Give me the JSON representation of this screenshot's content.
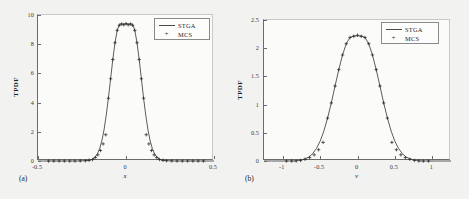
{
  "figure": {
    "background_color": "#f2f2f0",
    "panels": [
      {
        "sublabel": "(a)",
        "xlabel": "x",
        "ylabel": "TPDF",
        "legend": [
          {
            "label": "STGA",
            "symbol": "line"
          },
          {
            "label": "MCS",
            "symbol": "plus"
          }
        ],
        "xticks": [
          "-0.5",
          "0",
          "0.5"
        ],
        "yticks": [
          "0",
          "2",
          "4",
          "6",
          "8",
          "10"
        ]
      },
      {
        "sublabel": "(b)",
        "xlabel": "v",
        "ylabel": "TPDF",
        "legend": [
          {
            "label": "STGA",
            "symbol": "line"
          },
          {
            "label": "MCS",
            "symbol": "plus"
          }
        ],
        "xticks": [
          "-1",
          "-0.5",
          "0",
          "0.5",
          "1"
        ],
        "yticks": [
          "0",
          "0.5",
          "1",
          "1.5",
          "2",
          "2.5"
        ]
      }
    ]
  },
  "chart_data": [
    {
      "type": "line",
      "panel": "(a)",
      "title": "",
      "xlabel": "x",
      "ylabel": "TPDF",
      "xlim": [
        -0.5,
        0.5
      ],
      "ylim": [
        0,
        10
      ],
      "xticks": [
        -0.5,
        0,
        0.5
      ],
      "yticks": [
        0,
        2,
        4,
        6,
        8,
        10
      ],
      "grid": false,
      "legend_position": "upper right",
      "series": [
        {
          "name": "STGA",
          "style": "solid-line",
          "color": "#4a4a4a",
          "x": [
            -0.5,
            -0.475,
            -0.45,
            -0.425,
            -0.4,
            -0.375,
            -0.35,
            -0.325,
            -0.3,
            -0.275,
            -0.25,
            -0.225,
            -0.2,
            -0.1875,
            -0.175,
            -0.1625,
            -0.15,
            -0.1375,
            -0.125,
            -0.1125,
            -0.1,
            -0.0875,
            -0.075,
            -0.0625,
            -0.05,
            -0.0375,
            -0.025,
            -0.0125,
            0,
            0.0125,
            0.025,
            0.0375,
            0.05,
            0.0625,
            0.075,
            0.0875,
            0.1,
            0.1125,
            0.125,
            0.1375,
            0.15,
            0.1625,
            0.175,
            0.1875,
            0.2,
            0.225,
            0.25,
            0.275,
            0.3,
            0.325,
            0.35,
            0.375,
            0.4,
            0.425,
            0.45,
            0.475,
            0.5
          ],
          "y": [
            0.0,
            0.0,
            0.0,
            0.0,
            0.0,
            0.0,
            0.0,
            0.0,
            0.0,
            0.0,
            0.01,
            0.02,
            0.07,
            0.14,
            0.27,
            0.49,
            0.84,
            1.37,
            2.12,
            3.11,
            4.3,
            5.63,
            6.95,
            8.1,
            8.95,
            9.36,
            9.4,
            9.36,
            9.4,
            9.36,
            9.4,
            9.36,
            8.95,
            8.1,
            6.95,
            5.63,
            4.3,
            3.11,
            2.12,
            1.37,
            0.84,
            0.49,
            0.27,
            0.14,
            0.07,
            0.02,
            0.01,
            0.0,
            0.0,
            0.0,
            0.0,
            0.0,
            0.0,
            0.0,
            0.0,
            0.0,
            0.0
          ]
        },
        {
          "name": "MCS",
          "style": "plus-markers",
          "color": "#2a2a2a",
          "x": [
            -0.44,
            -0.41,
            -0.38,
            -0.35,
            -0.32,
            -0.29,
            -0.26,
            -0.23,
            -0.21,
            -0.19,
            -0.175,
            -0.16,
            -0.145,
            -0.13,
            -0.115,
            -0.1,
            -0.0875,
            -0.075,
            -0.0625,
            -0.05,
            -0.0375,
            -0.025,
            -0.0125,
            0,
            0.0125,
            0.025,
            0.0375,
            0.05,
            0.0625,
            0.075,
            0.0875,
            0.1,
            0.115,
            0.13,
            0.145,
            0.16,
            0.175,
            0.19,
            0.21,
            0.23,
            0.26,
            0.29,
            0.32,
            0.35,
            0.38,
            0.41,
            0.44
          ],
          "y": [
            0.0,
            0.0,
            0.0,
            0.0,
            0.0,
            0.0,
            0.01,
            0.02,
            0.05,
            0.1,
            0.24,
            0.42,
            0.72,
            1.17,
            1.8,
            4.3,
            5.63,
            6.95,
            8.1,
            8.95,
            9.3,
            9.38,
            9.33,
            9.41,
            9.33,
            9.38,
            9.3,
            8.95,
            8.1,
            6.95,
            5.63,
            4.3,
            1.8,
            1.17,
            0.72,
            0.42,
            0.24,
            0.1,
            0.05,
            0.02,
            0.01,
            0.0,
            0.0,
            0.0,
            0.0,
            0.0,
            0.0
          ]
        }
      ],
      "peak": {
        "x": 0,
        "y": 9.4
      }
    },
    {
      "type": "line",
      "panel": "(b)",
      "title": "",
      "xlabel": "v",
      "ylabel": "TPDF",
      "xlim": [
        -1.25,
        1.25
      ],
      "ylim": [
        0,
        2.5
      ],
      "xticks": [
        -1,
        -0.5,
        0,
        0.5,
        1
      ],
      "yticks": [
        0,
        0.5,
        1,
        1.5,
        2,
        2.5
      ],
      "grid": false,
      "legend_position": "upper right",
      "series": [
        {
          "name": "STGA",
          "style": "solid-line",
          "color": "#4a4a4a",
          "x": [
            -1.25,
            -1.15,
            -1.05,
            -0.95,
            -0.85,
            -0.8,
            -0.75,
            -0.7,
            -0.65,
            -0.6,
            -0.55,
            -0.5,
            -0.45,
            -0.4,
            -0.35,
            -0.3,
            -0.25,
            -0.2,
            -0.15,
            -0.1,
            -0.05,
            0,
            0.05,
            0.1,
            0.15,
            0.2,
            0.25,
            0.3,
            0.35,
            0.4,
            0.45,
            0.5,
            0.55,
            0.6,
            0.65,
            0.7,
            0.75,
            0.8,
            0.85,
            0.95,
            1.05,
            1.15,
            1.25
          ],
          "y": [
            0.0,
            0.0,
            0.0,
            0.0,
            0.0,
            0.01,
            0.02,
            0.04,
            0.07,
            0.13,
            0.22,
            0.35,
            0.53,
            0.76,
            1.03,
            1.33,
            1.62,
            1.88,
            2.08,
            2.19,
            2.22,
            2.22,
            2.22,
            2.19,
            2.08,
            1.88,
            1.62,
            1.33,
            1.03,
            0.76,
            0.53,
            0.35,
            0.22,
            0.13,
            0.07,
            0.04,
            0.02,
            0.01,
            0.0,
            0.0,
            0.0,
            0.0,
            0.0
          ]
        },
        {
          "name": "MCS",
          "style": "plus-markers",
          "color": "#2a2a2a",
          "x": [
            -0.95,
            -0.88,
            -0.82,
            -0.76,
            -0.7,
            -0.64,
            -0.58,
            -0.52,
            -0.46,
            -0.4,
            -0.35,
            -0.3,
            -0.25,
            -0.2,
            -0.15,
            -0.1,
            -0.05,
            0,
            0.05,
            0.1,
            0.15,
            0.2,
            0.25,
            0.3,
            0.35,
            0.4,
            0.46,
            0.52,
            0.58,
            0.64,
            0.7,
            0.76,
            0.82,
            0.88,
            0.95
          ],
          "y": [
            0.0,
            0.0,
            0.0,
            0.01,
            0.03,
            0.06,
            0.11,
            0.2,
            0.33,
            0.76,
            1.03,
            1.33,
            1.62,
            1.88,
            2.08,
            2.19,
            2.21,
            2.23,
            2.21,
            2.19,
            2.08,
            1.88,
            1.62,
            1.33,
            1.03,
            0.76,
            0.33,
            0.2,
            0.11,
            0.06,
            0.03,
            0.01,
            0.0,
            0.0,
            0.0
          ]
        }
      ],
      "peak": {
        "x": 0,
        "y": 2.22
      }
    }
  ]
}
